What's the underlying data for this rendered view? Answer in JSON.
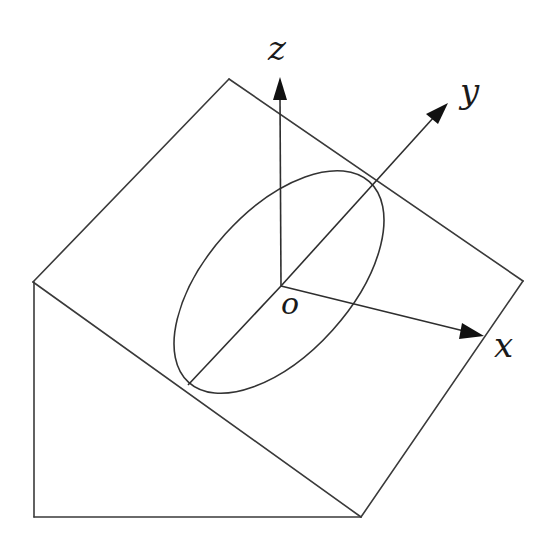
{
  "diagram": {
    "colors": {
      "stroke": "#333333",
      "arrow": "#111111",
      "background": "#ffffff"
    },
    "labels": {
      "z": "z",
      "y": "y",
      "x": "x",
      "origin": "o"
    },
    "points": {
      "origin": [
        281,
        286
      ],
      "z_tip": [
        280,
        77
      ],
      "y_tip": [
        448,
        103
      ],
      "x_tip": [
        484,
        336
      ],
      "top_vertex": [
        229,
        79
      ],
      "left_vertex": [
        33,
        282
      ],
      "right_vertex": [
        523,
        281
      ],
      "bottom_left": [
        34,
        517
      ],
      "bottom_right": [
        361,
        517
      ],
      "diameter_end": [
        188,
        385
      ]
    },
    "ellipse": {
      "cx": 279,
      "cy": 282,
      "rx": 135,
      "ry": 72,
      "rotation_deg": -48
    }
  }
}
